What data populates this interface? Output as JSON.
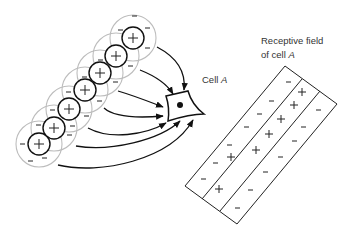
{
  "labels": {
    "cell": {
      "text": "Cell ",
      "italic": "A"
    },
    "receptive_field_line1": "Receptive field",
    "receptive_field_line2": {
      "text": "of cell ",
      "italic": "A"
    }
  },
  "colors": {
    "ink": "#111111",
    "outer_ring": "#bbbbbb",
    "text": "#333333"
  },
  "subunits": {
    "count": 7,
    "inner_sign": "+",
    "surround_sign": "−",
    "centers": [
      [
        39,
        144
      ],
      [
        54,
        128
      ],
      [
        69,
        109
      ],
      [
        85,
        90
      ],
      [
        100,
        73
      ],
      [
        116,
        56
      ],
      [
        133,
        38
      ]
    ]
  },
  "receptive_field": {
    "corners": {
      "top": [
        285,
        66
      ],
      "right": [
        337,
        104
      ],
      "bottom": [
        237,
        224
      ],
      "left": [
        185,
        186
      ]
    },
    "stripes": [
      {
        "sign": "−",
        "count": 6
      },
      {
        "sign": "+",
        "count": 7
      },
      {
        "sign": "−",
        "count": 6
      }
    ]
  }
}
